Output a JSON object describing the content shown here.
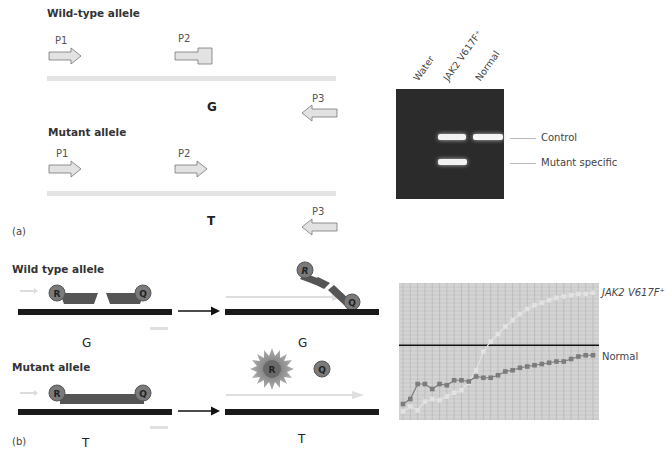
{
  "panel_a": {
    "tag": "(a)",
    "wild_type": {
      "heading": "Wild-type allele",
      "primer_1": "P1",
      "primer_2": "P2",
      "primer_3": "P3",
      "base": "G"
    },
    "mutant": {
      "heading": "Mutant allele",
      "primer_1": "P1",
      "primer_2": "P2",
      "primer_3": "P3",
      "base": "T"
    },
    "gel": {
      "lanes": [
        "Water",
        "JAK2 V617F⁺",
        "Normal"
      ],
      "band_labels": {
        "control": "Control",
        "mutant": "Mutant specific"
      },
      "colors": {
        "gel_bg": "#2a2a2a",
        "band": "#f4f4f4"
      }
    }
  },
  "panel_b": {
    "tag": "(b)",
    "wild_type": {
      "heading": "Wild type allele",
      "reporter": "R",
      "quencher": "Q",
      "base_before": "G",
      "base_after": "G"
    },
    "mutant": {
      "heading": "Mutant allele",
      "reporter": "R",
      "quencher": "Q",
      "base_before": "T",
      "base_after": "T"
    },
    "colors": {
      "probe_body": "#555555",
      "dye_circle": "#7a7a7a",
      "strand": "#1a1a1a",
      "primer": "#d8d8d8"
    }
  },
  "chart_data": {
    "type": "line",
    "title": "",
    "xlabel": "",
    "ylabel": "",
    "x": [
      1,
      2,
      3,
      4,
      5,
      6,
      7,
      8,
      9,
      10,
      11,
      12,
      13,
      14,
      15,
      16,
      17,
      18,
      19,
      20,
      21,
      22,
      23,
      24,
      25,
      26,
      27
    ],
    "series": [
      {
        "name": "JAK2 V617F⁺",
        "color": "#e2e2e2",
        "values": [
          2,
          6,
          3,
          10,
          12,
          11,
          14,
          17,
          19,
          25,
          35,
          50,
          58,
          64,
          70,
          75,
          80,
          84,
          87,
          89,
          91,
          93,
          94,
          95,
          96,
          96,
          97
        ]
      },
      {
        "name": "Normal",
        "color": "#7c7c7c",
        "values": [
          8,
          12,
          24,
          24,
          20,
          24,
          23,
          27,
          27,
          26,
          30,
          29,
          29,
          31,
          34,
          35,
          37,
          38,
          39,
          40,
          41,
          42,
          42,
          44,
          46,
          47,
          47
        ]
      }
    ],
    "threshold": 55,
    "ylim": [
      0,
      100
    ],
    "grid": true,
    "legend": "right-inline",
    "labels": {
      "mutant": "JAK2 V617F⁺",
      "normal": "Normal"
    }
  }
}
